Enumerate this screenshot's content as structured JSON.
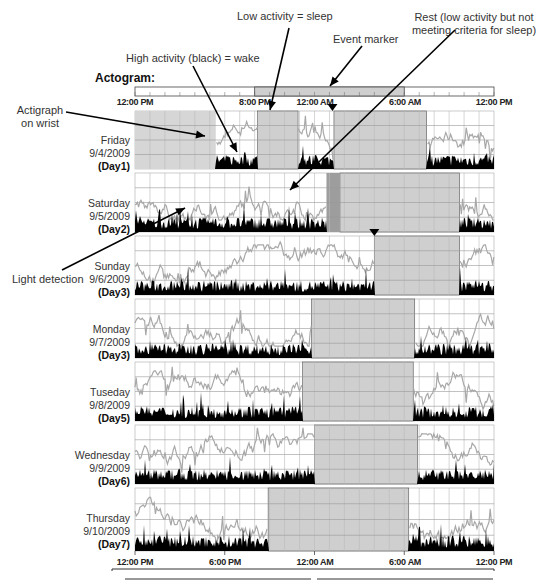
{
  "chart_data": {
    "type": "heatmap",
    "title": "Actogram:",
    "subtype": "actogram (double-plotted actigraphy)",
    "x_axis": {
      "range_hours": [
        12,
        36
      ],
      "tick_labels_top": [
        "12:00 PM",
        "8:00 PM",
        "12:00 AM",
        "6:00 AM",
        "12:00 PM"
      ],
      "tick_labels_bottom": [
        "12:00 PM",
        "6:00 PM",
        "12:00 AM",
        "6:00 AM",
        "12:00 PM"
      ]
    },
    "legend_bar": {
      "sleep_start": "8:00 PM",
      "sleep_end": "6:00 AM"
    },
    "annotations": [
      {
        "id": "low_activity",
        "text": "Low activity = sleep"
      },
      {
        "id": "rest",
        "text": "Rest (low activity but not meeting criteria for sleep)"
      },
      {
        "id": "event_marker",
        "text": "Event marker"
      },
      {
        "id": "high_activity",
        "text": "High activity (black) = wake"
      },
      {
        "id": "actigraph",
        "text": "Actigraph on wrist"
      },
      {
        "id": "light",
        "text": "Light detection"
      }
    ],
    "series_legend": [
      {
        "name": "Activity",
        "color": "#000000"
      },
      {
        "name": "Light",
        "color": "#aaaaaa"
      },
      {
        "name": "Sleep interval",
        "color": "#cfcfcf"
      }
    ],
    "days": [
      {
        "weekday": "Friday",
        "date": "9/4/2009",
        "day": "(Day1)",
        "off_wrist": [
          12.0,
          17.4
        ],
        "sleep": [
          [
            20.2,
            22.9
          ]
        ],
        "sleep2": [
          [
            25.3,
            31.5
          ]
        ],
        "rest": [],
        "event_marker_hour": 25.2
      },
      {
        "weekday": "Saturday",
        "date": "9/5/2009",
        "day": "(Day2)",
        "off_wrist": null,
        "sleep": [
          [
            25.7,
            33.7
          ]
        ],
        "rest": [
          [
            24.8,
            25.7
          ]
        ],
        "event_marker_hour": null
      },
      {
        "weekday": "Sunday",
        "date": "9/6/2009",
        "day": "(Day3)",
        "off_wrist": null,
        "sleep": [
          [
            28.0,
            33.7
          ]
        ],
        "rest": [],
        "event_marker_hour": 28.0
      },
      {
        "weekday": "Monday",
        "date": "9/7/2009",
        "day": "(Day3)",
        "off_wrist": null,
        "sleep": [
          [
            23.8,
            30.7
          ]
        ],
        "rest": [],
        "event_marker_hour": null
      },
      {
        "weekday": "Tuseday",
        "date": "9/8/2009",
        "day": "(Day5)",
        "off_wrist": null,
        "sleep": [
          [
            23.2,
            30.6
          ]
        ],
        "rest": [],
        "event_marker_hour": null
      },
      {
        "weekday": "Wednesday",
        "date": "9/9/2009",
        "day": "(Day6)",
        "off_wrist": null,
        "sleep": [
          [
            24.0,
            30.9
          ]
        ],
        "rest": [],
        "event_marker_hour": null
      },
      {
        "weekday": "Thursday",
        "date": "9/10/2009",
        "day": "(Day7)",
        "off_wrist": null,
        "sleep": [
          [
            20.9,
            30.3
          ]
        ],
        "rest": [],
        "event_marker_hour": null
      }
    ]
  },
  "labels": {
    "title": "Actogram:",
    "low_activity": "Low activity = sleep",
    "rest_line1": "Rest (low activity but not",
    "rest_line2": "meeting criteria for sleep)",
    "event_marker": "Event marker",
    "high_activity": "High activity (black) = wake",
    "actigraph_line1": "Actigraph",
    "actigraph_line2": "on wrist",
    "light": "Light detection"
  },
  "top_ticks": [
    "12:00 PM",
    "8:00 PM",
    "12:00 AM",
    "6:00 AM",
    "12:00 PM"
  ],
  "bottom_ticks": [
    "12:00 PM",
    "6:00 PM",
    "12:00 AM",
    "6:00 AM",
    "12:00 PM"
  ],
  "days": [
    {
      "weekday": "Friday",
      "date": "9/4/2009",
      "day": "(Day1)"
    },
    {
      "weekday": "Saturday",
      "date": "9/5/2009",
      "day": "(Day2)"
    },
    {
      "weekday": "Sunday",
      "date": "9/6/2009",
      "day": "(Day3)"
    },
    {
      "weekday": "Monday",
      "date": "9/7/2009",
      "day": "(Day3)"
    },
    {
      "weekday": "Tuseday",
      "date": "9/8/2009",
      "day": "(Day5)"
    },
    {
      "weekday": "Wednesday",
      "date": "9/9/2009",
      "day": "(Day6)"
    },
    {
      "weekday": "Thursday",
      "date": "9/10/2009",
      "day": "(Day7)"
    }
  ],
  "colors": {
    "sleep": "#cfcfcf",
    "light": "#a8a8a8",
    "activity": "#000000",
    "grid": "#9a9a9a",
    "offwrist": "#d6d6d6"
  }
}
